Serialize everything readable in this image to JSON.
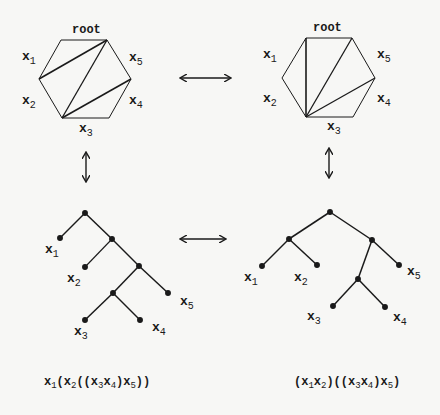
{
  "diagram": {
    "left": {
      "hexagon": {
        "root_label": "root",
        "side_labels": [
          {
            "var": "x",
            "sub": "1"
          },
          {
            "var": "x",
            "sub": "2"
          },
          {
            "var": "x",
            "sub": "3"
          },
          {
            "var": "x",
            "sub": "4"
          },
          {
            "var": "x",
            "sub": "5"
          }
        ]
      },
      "tree": {
        "leaf_labels": [
          {
            "var": "x",
            "sub": "1"
          },
          {
            "var": "x",
            "sub": "2"
          },
          {
            "var": "x",
            "sub": "3"
          },
          {
            "var": "x",
            "sub": "4"
          },
          {
            "var": "x",
            "sub": "5"
          }
        ]
      },
      "expression": "x1(x2((x3x4)x5))"
    },
    "right": {
      "hexagon": {
        "root_label": "root",
        "side_labels": [
          {
            "var": "x",
            "sub": "1"
          },
          {
            "var": "x",
            "sub": "2"
          },
          {
            "var": "x",
            "sub": "3"
          },
          {
            "var": "x",
            "sub": "4"
          },
          {
            "var": "x",
            "sub": "5"
          }
        ]
      },
      "tree": {
        "leaf_labels": [
          {
            "var": "x",
            "sub": "1"
          },
          {
            "var": "x",
            "sub": "2"
          },
          {
            "var": "x",
            "sub": "3"
          },
          {
            "var": "x",
            "sub": "4"
          },
          {
            "var": "x",
            "sub": "5"
          }
        ]
      },
      "expression": "(x1x2)((x3x4)x5)"
    },
    "arrows": [
      {
        "type": "double-horizontal",
        "between": "hexagons"
      },
      {
        "type": "double-horizontal",
        "between": "trees"
      },
      {
        "type": "double-vertical",
        "between": "left hexagon and left tree"
      },
      {
        "type": "double-vertical",
        "between": "right hexagon and right tree"
      }
    ],
    "colors": {
      "ink": "#1a1a1a",
      "paper": "#f7f7f5"
    }
  },
  "expr_parts": {
    "left": [
      "x",
      "1",
      "(x",
      "2",
      "((x",
      "3",
      "x",
      "4",
      ")x",
      "5",
      "))"
    ],
    "right": [
      "(x",
      "1",
      "x",
      "2",
      ")((x",
      "3",
      "x",
      "4",
      ")x",
      "5",
      ")"
    ]
  }
}
